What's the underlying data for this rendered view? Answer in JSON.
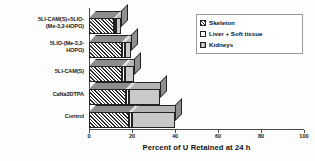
{
  "chart_data": {
    "type": "bar",
    "orientation": "horizontal",
    "stacked": true,
    "style": "3d",
    "title": "",
    "xlabel": "Percent of U Retained at 24 h",
    "ylabel": "",
    "xlim": [
      0,
      100
    ],
    "xticks": [
      0,
      20,
      40,
      60,
      80,
      100
    ],
    "xtick_labels": [
      "0",
      "20",
      "40",
      "60",
      "80",
      "100"
    ],
    "grid": false,
    "legend_position": "top-right",
    "categories": [
      "5LI-CAM(S)+5LIO-\n(Me-3,2-HOPO)",
      "5LIO-(Me-3,2-\nHOPO)",
      "5LI-CAM(S)",
      "CaNa3DTPA",
      "Control"
    ],
    "series": [
      {
        "name": "Skeleton",
        "color": "#2a2a2a",
        "pattern": "diagonal-hatch",
        "values": [
          11.5,
          15.5,
          15.5,
          17.0,
          18.5
        ]
      },
      {
        "name": "Liver + Soft tissue",
        "color": "#ffffff",
        "pattern": "blank",
        "values": [
          1.2,
          1.2,
          1.2,
          1.5,
          1.5
        ]
      },
      {
        "name": "Kidneys",
        "color": "#c9c9c9",
        "pattern": "solid-grey",
        "values": [
          2.3,
          2.8,
          4.3,
          14.5,
          20.0
        ]
      }
    ],
    "totals": [
      15.0,
      19.5,
      21.0,
      33.0,
      40.0
    ]
  },
  "legend": {
    "items": [
      {
        "label": "Skeleton",
        "swatch": "skeleton-swatch-icon"
      },
      {
        "label": "Liver + Soft tissue",
        "swatch": "liver-swatch-icon"
      },
      {
        "label": "Kidneys",
        "swatch": "kidneys-swatch-icon"
      }
    ]
  }
}
